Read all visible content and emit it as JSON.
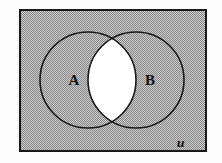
{
  "figure": {
    "kind": "venn-diagram",
    "title": "",
    "sets": [
      {
        "id": "A",
        "label": "A",
        "label_x": 74,
        "label_y": 85,
        "cx": 88,
        "cy": 80,
        "r": 48
      },
      {
        "id": "B",
        "label": "B",
        "label_x": 150,
        "label_y": 85,
        "cx": 136,
        "cy": 80,
        "r": 48
      }
    ],
    "universe": {
      "label": "ᵤ",
      "label_alt": "U",
      "label_x": 178,
      "label_y": 145,
      "rect": {
        "x": 19,
        "y": 9,
        "width": 188,
        "height": 143
      }
    },
    "shading": {
      "description": "Shaded: everything except the intersection of A and B",
      "shaded_region_fill": "#a9a9a9",
      "unshaded_region_fill": "#ffffff",
      "unshaded_region_name": "A intersect B",
      "outline_color": "#181818",
      "page_background": "#fdfdfd",
      "outline_width_circles": 1.6,
      "outline_width_rect": 2.0
    }
  }
}
